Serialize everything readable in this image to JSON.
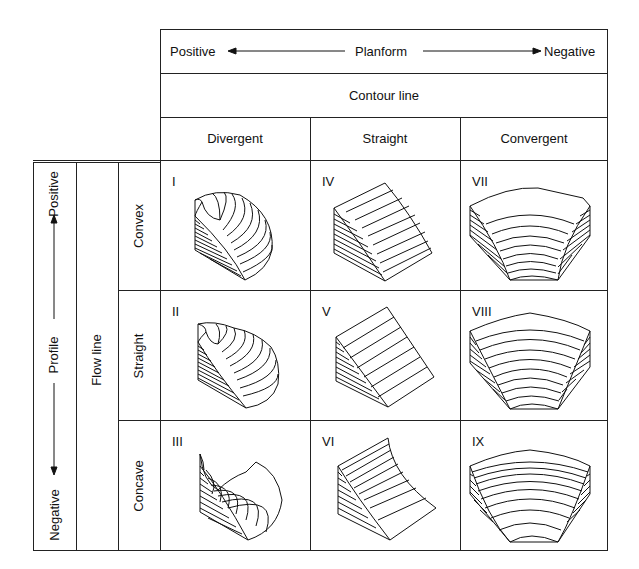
{
  "header": {
    "planform": {
      "left": "Positive",
      "center": "Planform",
      "right": "Negative"
    },
    "contour_line": "Contour line",
    "columns": [
      "Divergent",
      "Straight",
      "Convergent"
    ]
  },
  "left": {
    "profile": {
      "top": "Positive",
      "center": "Profile",
      "bottom": "Negative"
    },
    "flow_line": "Flow line",
    "rows": [
      "Convex",
      "Straight",
      "Concave"
    ]
  },
  "cells": [
    {
      "id": "I",
      "row": "Convex",
      "col": "Divergent"
    },
    {
      "id": "IV",
      "row": "Convex",
      "col": "Straight"
    },
    {
      "id": "VII",
      "row": "Convex",
      "col": "Convergent"
    },
    {
      "id": "II",
      "row": "Straight",
      "col": "Divergent"
    },
    {
      "id": "V",
      "row": "Straight",
      "col": "Straight"
    },
    {
      "id": "VIII",
      "row": "Straight",
      "col": "Convergent"
    },
    {
      "id": "III",
      "row": "Concave",
      "col": "Divergent"
    },
    {
      "id": "VI",
      "row": "Concave",
      "col": "Straight"
    },
    {
      "id": "IX",
      "row": "Concave",
      "col": "Convergent"
    }
  ]
}
